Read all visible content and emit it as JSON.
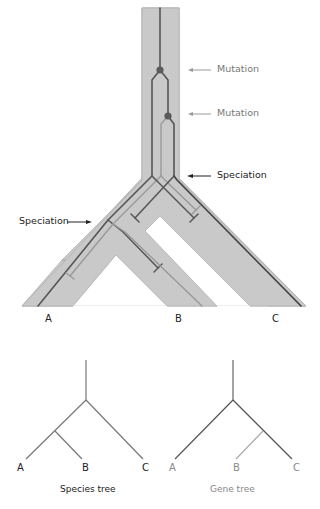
{
  "annotations": {
    "mutation_1": "Mutation",
    "mutation_2": "Mutation",
    "speciation_1": "Speciation",
    "speciation_2": "Speciation"
  },
  "species_labels": [
    "A",
    "B",
    "C"
  ],
  "species_tree": {
    "caption": "Species tree",
    "tips": [
      "A",
      "B",
      "C"
    ]
  },
  "gene_tree": {
    "caption": "Gene tree",
    "tips": [
      "A",
      "B",
      "C"
    ]
  },
  "colors": {
    "band": "#c8c8c8",
    "band_edge": "#a8a8a8",
    "lineage_dark": "#555555",
    "lineage_light": "#909090",
    "mutation_dot": "#5a5a5a",
    "arrow_gray": "#999999",
    "arrow_dark": "#222222",
    "text_dark": "#222222",
    "text_gray": "#777777"
  }
}
